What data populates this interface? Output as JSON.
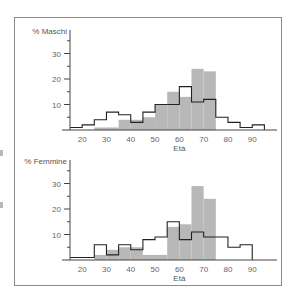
{
  "chart_data": [
    {
      "type": "bar",
      "title": "",
      "ylabel": "% Maschi",
      "xlabel": "Età",
      "x_ticks": [
        20,
        30,
        40,
        50,
        60,
        70,
        80,
        90
      ],
      "y_ticks": [
        10,
        20,
        30
      ],
      "ylim": [
        0,
        35
      ],
      "xlim": [
        15,
        97
      ],
      "bin_width": 5,
      "bin_starts": [
        15,
        20,
        25,
        30,
        35,
        40,
        45,
        50,
        55,
        60,
        65,
        70,
        75,
        80,
        85,
        90
      ],
      "series": [
        {
          "name": "filled",
          "style": "gray-filled-bars",
          "values": [
            0,
            0,
            1,
            1,
            4,
            4,
            5,
            10,
            15,
            13,
            24,
            23,
            0,
            0,
            0,
            0
          ]
        },
        {
          "name": "outline",
          "style": "black-step-outline",
          "values": [
            1,
            2,
            4,
            7,
            6,
            3,
            7,
            10,
            10,
            17,
            11,
            12,
            5,
            3,
            1,
            2
          ]
        }
      ],
      "grid": false,
      "legend": "none"
    },
    {
      "type": "bar",
      "title": "",
      "ylabel": "% Femmine",
      "xlabel": "Età",
      "x_ticks": [
        20,
        30,
        40,
        50,
        60,
        70,
        80,
        90
      ],
      "y_ticks": [
        10,
        20,
        30
      ],
      "ylim": [
        0,
        35
      ],
      "xlim": [
        15,
        97
      ],
      "bin_width": 5,
      "bin_starts": [
        15,
        20,
        25,
        30,
        35,
        40,
        45,
        50,
        55,
        60,
        65,
        70,
        75,
        80,
        85
      ],
      "series": [
        {
          "name": "filled",
          "style": "gray-filled-bars",
          "values": [
            0,
            0,
            2,
            4,
            5,
            5,
            2,
            2,
            13,
            14,
            29,
            24,
            0,
            0,
            0
          ]
        },
        {
          "name": "outline",
          "style": "black-step-outline",
          "values": [
            1,
            1,
            6,
            2,
            6,
            4,
            8,
            9,
            15,
            8,
            11,
            9,
            9,
            5,
            6
          ]
        }
      ],
      "grid": false,
      "legend": "none"
    }
  ],
  "colors": {
    "bar_fill": "#b8b8b8",
    "outline": "#222222",
    "axis": "#444444",
    "frame": "#8a8a8a",
    "text": "#555555"
  }
}
